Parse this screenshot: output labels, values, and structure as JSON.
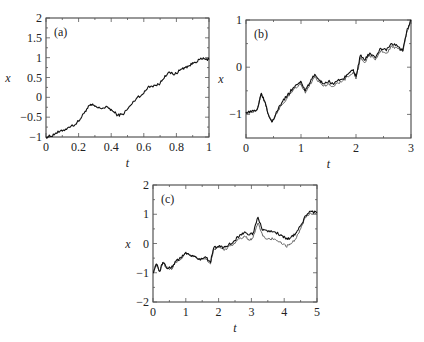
{
  "chart_data": [
    {
      "type": "line",
      "panel_label": "(a)",
      "xlabel": "t",
      "ylabel": "x",
      "xlim": [
        0,
        1
      ],
      "ylim": [
        -1,
        2
      ],
      "xticks": [
        0,
        0.2,
        0.4,
        0.6,
        0.8,
        1
      ],
      "xtick_labels": [
        "0",
        "0.2",
        "0.4",
        "0.6",
        "0.8",
        "1"
      ],
      "yticks": [
        -1,
        -0.5,
        0,
        0.5,
        1,
        1.5,
        2
      ],
      "ytick_labels": [
        "−1",
        "−0.5",
        "0",
        "0.5",
        "1",
        "1.5",
        "2"
      ],
      "grid": false,
      "frame": {
        "x0": 46,
        "y0": 18,
        "x1": 209,
        "y1": 137
      },
      "series": [
        {
          "name": "trajectory",
          "color": "#111111",
          "x": [
            0,
            0.03,
            0.06,
            0.1,
            0.14,
            0.18,
            0.21,
            0.24,
            0.27,
            0.29,
            0.32,
            0.35,
            0.38,
            0.41,
            0.44,
            0.47,
            0.5,
            0.53,
            0.56,
            0.6,
            0.63,
            0.67,
            0.7,
            0.73,
            0.76,
            0.79,
            0.82,
            0.85,
            0.88,
            0.91,
            0.94,
            0.97,
            1.0
          ],
          "y": [
            -1.0,
            -0.98,
            -0.9,
            -0.85,
            -0.75,
            -0.68,
            -0.55,
            -0.35,
            -0.2,
            -0.2,
            -0.27,
            -0.27,
            -0.25,
            -0.35,
            -0.45,
            -0.43,
            -0.3,
            -0.15,
            0.0,
            0.1,
            0.28,
            0.3,
            0.35,
            0.55,
            0.62,
            0.58,
            0.68,
            0.75,
            0.8,
            0.88,
            0.95,
            0.97,
            0.95
          ]
        }
      ]
    },
    {
      "type": "line",
      "panel_label": "(b)",
      "xlabel": "t",
      "ylabel": "x",
      "xlim": [
        0,
        3
      ],
      "ylim": [
        -1.5,
        1
      ],
      "xticks": [
        0,
        1,
        2,
        3
      ],
      "xtick_labels": [
        "0",
        "1",
        "2",
        "3"
      ],
      "yticks": [
        -1,
        0,
        1
      ],
      "ytick_labels": [
        "−1",
        "0",
        "1"
      ],
      "grid": false,
      "frame": {
        "x0": 246,
        "y0": 20,
        "x1": 411,
        "y1": 138
      },
      "series": [
        {
          "name": "trajectory 1",
          "color": "#111111",
          "x": [
            0,
            0.1,
            0.2,
            0.28,
            0.35,
            0.42,
            0.48,
            0.55,
            0.65,
            0.75,
            0.85,
            0.95,
            1.0,
            1.08,
            1.15,
            1.25,
            1.32,
            1.4,
            1.5,
            1.58,
            1.65,
            1.75,
            1.85,
            1.95,
            2.0,
            2.08,
            2.15,
            2.25,
            2.35,
            2.45,
            2.55,
            2.65,
            2.75,
            2.85,
            2.92,
            3.0
          ],
          "y": [
            -0.95,
            -0.95,
            -0.9,
            -0.55,
            -0.75,
            -1.05,
            -1.15,
            -0.95,
            -0.75,
            -0.6,
            -0.45,
            -0.35,
            -0.3,
            -0.5,
            -0.35,
            -0.15,
            -0.25,
            -0.35,
            -0.3,
            -0.35,
            -0.3,
            -0.25,
            -0.15,
            -0.05,
            -0.2,
            0.25,
            0.15,
            0.3,
            0.2,
            0.4,
            0.35,
            0.5,
            0.45,
            0.35,
            0.75,
            1.0
          ]
        },
        {
          "name": "trajectory 2",
          "color": "#666666",
          "x": [
            0,
            0.1,
            0.2,
            0.28,
            0.35,
            0.42,
            0.48,
            0.55,
            0.65,
            0.75,
            0.85,
            0.95,
            1.0,
            1.08,
            1.15,
            1.25,
            1.32,
            1.4,
            1.5,
            1.58,
            1.65,
            1.75,
            1.85,
            1.95,
            2.0,
            2.08,
            2.15,
            2.25,
            2.35,
            2.45,
            2.55,
            2.65,
            2.75,
            2.85,
            2.92,
            3.0
          ],
          "y": [
            -0.95,
            -0.95,
            -0.9,
            -0.55,
            -0.75,
            -1.05,
            -1.15,
            -0.98,
            -0.8,
            -0.65,
            -0.5,
            -0.4,
            -0.35,
            -0.55,
            -0.4,
            -0.2,
            -0.3,
            -0.4,
            -0.35,
            -0.4,
            -0.35,
            -0.3,
            -0.2,
            -0.1,
            -0.25,
            0.2,
            0.1,
            0.25,
            0.15,
            0.35,
            0.3,
            0.45,
            0.4,
            0.33,
            0.72,
            0.98
          ]
        }
      ]
    },
    {
      "type": "line",
      "panel_label": "(c)",
      "xlabel": "t",
      "ylabel": "x",
      "xlim": [
        0,
        5
      ],
      "ylim": [
        -2,
        2
      ],
      "xticks": [
        0,
        1,
        2,
        3,
        4,
        5
      ],
      "xtick_labels": [
        "0",
        "1",
        "2",
        "3",
        "4",
        "5"
      ],
      "yticks": [
        -2,
        -1,
        0,
        1,
        2
      ],
      "ytick_labels": [
        "−2",
        "−1",
        "0",
        "1",
        "2"
      ],
      "grid": false,
      "frame": {
        "x0": 153,
        "y0": 185,
        "x1": 317,
        "y1": 302
      },
      "series": [
        {
          "name": "trajectory 1",
          "color": "#111111",
          "x": [
            0,
            0.1,
            0.2,
            0.3,
            0.4,
            0.55,
            0.7,
            0.85,
            1.0,
            1.15,
            1.3,
            1.45,
            1.6,
            1.75,
            1.85,
            2.0,
            2.15,
            2.3,
            2.5,
            2.65,
            2.8,
            2.95,
            3.05,
            3.2,
            3.35,
            3.5,
            3.7,
            3.9,
            4.05,
            4.2,
            4.35,
            4.5,
            4.65,
            4.8,
            5.0
          ],
          "y": [
            -1.0,
            -0.7,
            -0.95,
            -0.65,
            -0.8,
            -0.85,
            -0.6,
            -0.5,
            -0.3,
            -0.4,
            -0.45,
            -0.55,
            -0.45,
            -0.65,
            -0.15,
            -0.1,
            -0.15,
            -0.05,
            0.1,
            0.3,
            0.4,
            0.3,
            0.35,
            0.9,
            0.45,
            0.4,
            0.4,
            0.3,
            0.15,
            0.2,
            0.35,
            0.6,
            0.95,
            1.1,
            1.05
          ]
        },
        {
          "name": "trajectory 2",
          "color": "#666666",
          "x": [
            0,
            0.1,
            0.2,
            0.3,
            0.4,
            0.55,
            0.7,
            0.85,
            1.0,
            1.15,
            1.3,
            1.45,
            1.6,
            1.75,
            1.85,
            2.0,
            2.15,
            2.3,
            2.5,
            2.65,
            2.8,
            2.95,
            3.05,
            3.2,
            3.35,
            3.5,
            3.7,
            3.9,
            4.05,
            4.2,
            4.35,
            4.5,
            4.65,
            4.8,
            5.0
          ],
          "y": [
            -1.0,
            -0.7,
            -0.95,
            -0.65,
            -0.8,
            -0.88,
            -0.63,
            -0.53,
            -0.33,
            -0.43,
            -0.48,
            -0.58,
            -0.5,
            -0.7,
            -0.2,
            -0.15,
            -0.22,
            -0.12,
            0.0,
            0.18,
            0.25,
            0.12,
            0.2,
            0.7,
            0.25,
            0.15,
            0.15,
            0.05,
            -0.1,
            -0.02,
            0.15,
            0.5,
            0.9,
            1.05,
            1.0
          ]
        }
      ]
    }
  ]
}
